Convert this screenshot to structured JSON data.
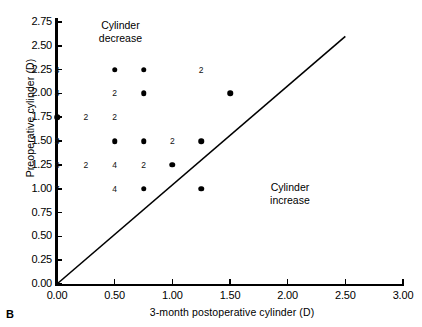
{
  "panel": {
    "label": "B"
  },
  "axes": {
    "x": {
      "title": "3-month postoperative cylinder (D)",
      "ticks": [
        "0.00",
        "0.50",
        "1.00",
        "1.50",
        "2.00",
        "2.50",
        "3.00"
      ],
      "min": 0.0,
      "max": 3.0,
      "step": 0.5
    },
    "y": {
      "title": "Preoperative cylinder (D)",
      "ticks": [
        "0.00",
        "0.25",
        "0.50",
        "0.75",
        "1.00",
        "1.25",
        "1.50",
        "1.75",
        "2.00",
        "2.25",
        "2.50",
        "2.75"
      ],
      "min": 0.0,
      "max": 2.75,
      "step": 0.25
    }
  },
  "annotations": [
    {
      "name": "cylinder-decrease",
      "line1": "Cylinder",
      "line2": "decrease",
      "x": 0.55,
      "y": 2.72
    },
    {
      "name": "cylinder-increase",
      "line1": "Cylinder",
      "line2": "increase",
      "x": 2.02,
      "y": 1.02
    }
  ],
  "reference_line": {
    "label": "y = x",
    "x0": 0.0,
    "y0": 0.0,
    "x1": 2.5,
    "y1": 2.6
  },
  "chart_data": {
    "type": "scatter",
    "title": "",
    "xlabel": "3-month postoperative cylinder (D)",
    "ylabel": "Preoperative cylinder (D)",
    "xlim": [
      0.0,
      3.0
    ],
    "ylim": [
      0.0,
      2.75
    ],
    "grid": false,
    "legend": null,
    "marker_note": "Filled dot = 1 eye; numeral = number of overlapping eyes at that coordinate",
    "points": [
      {
        "x": 0.0,
        "y": 2.25,
        "count": 4,
        "render": "count"
      },
      {
        "x": 0.0,
        "y": 2.0,
        "count": 4,
        "render": "count"
      },
      {
        "x": 0.0,
        "y": 1.75,
        "count": 1,
        "render": "dot"
      },
      {
        "x": 0.0,
        "y": 1.5,
        "count": 3,
        "render": "count",
        "bold": true
      },
      {
        "x": 0.0,
        "y": 1.25,
        "count": 8,
        "render": "count"
      },
      {
        "x": 0.0,
        "y": 1.0,
        "count": 7,
        "render": "count"
      },
      {
        "x": 0.25,
        "y": 1.75,
        "count": 2,
        "render": "count"
      },
      {
        "x": 0.25,
        "y": 1.25,
        "count": 2,
        "render": "count"
      },
      {
        "x": 0.5,
        "y": 2.25,
        "count": 1,
        "render": "dot"
      },
      {
        "x": 0.5,
        "y": 2.0,
        "count": 2,
        "render": "count"
      },
      {
        "x": 0.5,
        "y": 1.75,
        "count": 2,
        "render": "count"
      },
      {
        "x": 0.5,
        "y": 1.5,
        "count": 1,
        "render": "dot"
      },
      {
        "x": 0.5,
        "y": 1.25,
        "count": 4,
        "render": "count"
      },
      {
        "x": 0.5,
        "y": 1.0,
        "count": 4,
        "render": "count"
      },
      {
        "x": 0.75,
        "y": 2.25,
        "count": 1,
        "render": "dot"
      },
      {
        "x": 0.75,
        "y": 2.0,
        "count": 1,
        "render": "dot"
      },
      {
        "x": 0.75,
        "y": 1.5,
        "count": 1,
        "render": "dot"
      },
      {
        "x": 0.75,
        "y": 1.25,
        "count": 2,
        "render": "count"
      },
      {
        "x": 0.75,
        "y": 1.0,
        "count": 1,
        "render": "dot"
      },
      {
        "x": 1.0,
        "y": 1.5,
        "count": 2,
        "render": "count"
      },
      {
        "x": 1.0,
        "y": 1.25,
        "count": 1,
        "render": "dot"
      },
      {
        "x": 1.25,
        "y": 2.25,
        "count": 2,
        "render": "count"
      },
      {
        "x": 1.25,
        "y": 1.5,
        "count": 1,
        "render": "dot"
      },
      {
        "x": 1.25,
        "y": 1.0,
        "count": 1,
        "render": "dot"
      },
      {
        "x": 1.5,
        "y": 2.0,
        "count": 1,
        "render": "dot"
      }
    ]
  }
}
